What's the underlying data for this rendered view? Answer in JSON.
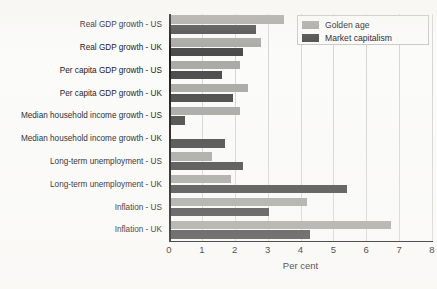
{
  "chart_data": {
    "type": "bar",
    "orientation": "horizontal",
    "title": "",
    "xlabel": "Per cent",
    "ylabel": "",
    "xlim": [
      0,
      8
    ],
    "xticks": [
      "0",
      "1",
      "2",
      "3",
      "4",
      "5",
      "6",
      "7",
      "8"
    ],
    "grid": true,
    "legend_position": "top-right",
    "categories": [
      "Real GDP growth - US",
      "Real GDP growth - UK",
      "Per capita GDP growth - US",
      "Per capita GDP growth - UK",
      "Median household income growth - US",
      "Median household income growth - UK",
      "Long-term unemployment - US",
      "Long-term unemployment - UK",
      "Inflation - US",
      "Inflation - UK"
    ],
    "series": [
      {
        "name": "Golden age",
        "color": "#a9a9a5",
        "values": [
          3.5,
          2.8,
          2.15,
          2.4,
          2.15,
          0.0,
          1.3,
          1.9,
          4.2,
          6.75
        ]
      },
      {
        "name": "Market capitalism",
        "color": "#4b4b4b",
        "values": [
          2.65,
          2.25,
          1.6,
          1.95,
          0.5,
          1.7,
          2.25,
          5.4,
          3.05,
          4.3
        ]
      }
    ]
  },
  "colors": {
    "golden_age": "#a9a9a5",
    "market_capitalism": "#4b4b4b",
    "axis": "#1c1c1c",
    "gridline": "#d7d7d2",
    "background": "#fbfbf9",
    "text": "#15151a"
  }
}
